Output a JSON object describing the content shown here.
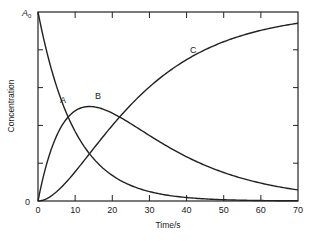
{
  "chart_data": {
    "type": "line",
    "title": "",
    "xlabel": "Time/s",
    "ylabel": "Concentration",
    "xlim": [
      0,
      70
    ],
    "ylim": [
      0,
      1
    ],
    "x_ticks": [
      0,
      10,
      20,
      30,
      40,
      50,
      60,
      70
    ],
    "x_tick_labels": [
      "0",
      "10",
      "20",
      "30",
      "40",
      "50",
      "60",
      "70"
    ],
    "y_tick_labels": {
      "bottom": "0",
      "top": "A0"
    },
    "y_top_label_main": "A",
    "y_top_label_sub": "0",
    "y_minor_ticks": [
      0.2,
      0.4,
      0.6,
      0.8
    ],
    "grid": false,
    "legend": "inline labels",
    "x": [
      0,
      5,
      10,
      14,
      20,
      25,
      30,
      40,
      50,
      60,
      70
    ],
    "series": [
      {
        "name": "A",
        "values": [
          1.0,
          0.61,
          0.37,
          0.25,
          0.14,
          0.08,
          0.05,
          0.02,
          0.007,
          0.002,
          0.001
        ]
      },
      {
        "name": "B",
        "values": [
          0.0,
          0.34,
          0.47,
          0.5,
          0.46,
          0.41,
          0.35,
          0.26,
          0.16,
          0.1,
          0.06
        ]
      },
      {
        "name": "C",
        "values": [
          0.0,
          0.05,
          0.16,
          0.25,
          0.4,
          0.51,
          0.6,
          0.72,
          0.83,
          0.9,
          0.94
        ]
      }
    ],
    "labels": {
      "A": "A",
      "B": "B",
      "C": "C"
    }
  }
}
